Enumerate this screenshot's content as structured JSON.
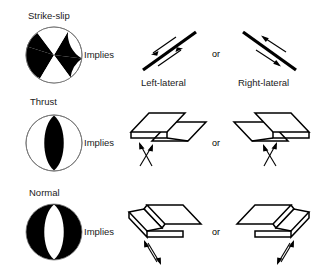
{
  "figure": {
    "title": "",
    "background_color": "#ffffff",
    "ink_color": "#000000",
    "rows": [
      {
        "id": "strike-slip",
        "mechanism_label": "Strike-slip",
        "implies_label": "Implies",
        "connector_label": "or",
        "beachball": {
          "type": "strike-slip",
          "description": "four quadrants, two black opposing wedges, two white wedges",
          "quadrant_fill": "#000000",
          "outline_color": "#555555"
        },
        "options": [
          {
            "caption": "Left-lateral",
            "sketch": "map-view fault trace with offset arrow pair, sinistral sense"
          },
          {
            "caption": "Right-lateral",
            "sketch": "map-view fault trace with offset arrow pair, dextral sense"
          }
        ]
      },
      {
        "id": "thrust",
        "mechanism_label": "Thrust",
        "implies_label": "Implies",
        "connector_label": "or",
        "beachball": {
          "type": "thrust",
          "description": "black lens (compressional) in centre of circle, white margins",
          "quadrant_fill": "#000000",
          "outline_color": "#555555"
        },
        "options": [
          {
            "caption": "",
            "sketch": "block diagram, hanging wall thrust over footwall, dipping right"
          },
          {
            "caption": "",
            "sketch": "block diagram, hanging wall thrust over footwall, dipping left"
          }
        ]
      },
      {
        "id": "normal",
        "mechanism_label": "Normal",
        "implies_label": "Implies",
        "connector_label": "or",
        "beachball": {
          "type": "normal",
          "description": "black circle with central white lens (dilatational)",
          "quadrant_fill": "#000000",
          "outline_color": "#555555"
        },
        "options": [
          {
            "caption": "",
            "sketch": "block diagram, hanging wall dropped down, dipping right"
          },
          {
            "caption": "",
            "sketch": "block diagram, hanging wall dropped down, dipping left"
          }
        ]
      }
    ]
  }
}
